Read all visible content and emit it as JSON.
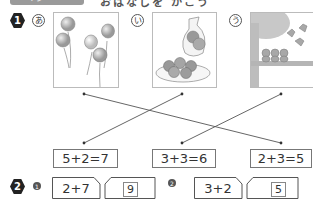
{
  "header": {
    "tab_label": "ペ ジ",
    "title_partial": "おはなしを かこう"
  },
  "problem1": {
    "number": "1",
    "pictures": [
      {
        "label": "あ",
        "description": "balloons",
        "icon": "balloons-icon"
      },
      {
        "label": "い",
        "description": "apples in bag and on plate",
        "icon": "apples-icon"
      },
      {
        "label": "う",
        "description": "birds on tree branch",
        "icon": "birds-icon"
      }
    ],
    "equations": [
      "5+2=7",
      "3+3=6",
      "2+3=5"
    ],
    "connections": [
      {
        "from": 0,
        "to": 2
      },
      {
        "from": 1,
        "to": 0
      },
      {
        "from": 2,
        "to": 1
      }
    ]
  },
  "problem2": {
    "number": "2",
    "items": [
      {
        "sub": "1",
        "expression": "2+7",
        "answer": "9"
      },
      {
        "sub": "2",
        "expression": "3+2",
        "answer": "5"
      }
    ]
  },
  "colors": {
    "badge": "#222222",
    "line": "#555555",
    "border": "#777777",
    "tab": "#9a9a9a"
  }
}
